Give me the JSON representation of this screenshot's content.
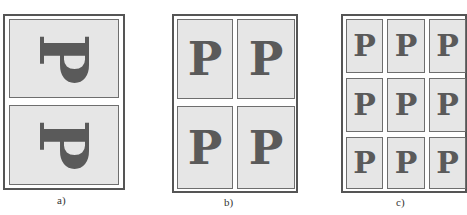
{
  "figure": {
    "panels": [
      {
        "id": "a",
        "caption": "a)",
        "layout": "2 pages per sheet (rotated landscape)",
        "pages": [
          {
            "glyph": "P",
            "rotation_deg": 90
          },
          {
            "glyph": "P",
            "rotation_deg": 90
          }
        ]
      },
      {
        "id": "b",
        "caption": "b)",
        "layout": "2x2 pages per sheet",
        "pages": [
          {
            "glyph": "P"
          },
          {
            "glyph": "P"
          },
          {
            "glyph": "P"
          },
          {
            "glyph": "P"
          }
        ]
      },
      {
        "id": "c",
        "caption": "c)",
        "layout": "3x3 pages per sheet",
        "pages": [
          {
            "glyph": "P"
          },
          {
            "glyph": "P"
          },
          {
            "glyph": "P"
          },
          {
            "glyph": "P"
          },
          {
            "glyph": "P"
          },
          {
            "glyph": "P"
          },
          {
            "glyph": "P"
          },
          {
            "glyph": "P"
          },
          {
            "glyph": "P"
          }
        ]
      }
    ],
    "colors": {
      "sheet_border": "#555555",
      "page_fill": "#e6e6e6",
      "page_border": "#6e6e6e",
      "glyph": "#5a5a5a"
    }
  }
}
